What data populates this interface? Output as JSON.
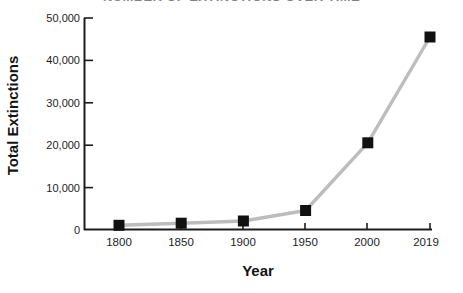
{
  "title": "NUMBER OF EXTINCTIONS OVER TIME",
  "chart_data": {
    "type": "line",
    "title": "NUMBER OF EXTINCTIONS OVER TIME",
    "subtitle": "",
    "xlabel": "Year",
    "ylabel": "Total Extinctions",
    "x": [
      1800,
      1850,
      1900,
      1950,
      2000,
      2019
    ],
    "xtick_labels": [
      "1800",
      "1850",
      "1900",
      "1950",
      "2000",
      "2019"
    ],
    "values": [
      1000,
      1500,
      2000,
      4500,
      20500,
      45500
    ],
    "ytick_labels": [
      "0",
      "10,000",
      "20,000",
      "30,000",
      "40,000",
      "50,000"
    ],
    "ytick_values": [
      0,
      10000,
      20000,
      30000,
      40000,
      50000
    ],
    "ylim": [
      0,
      50000
    ],
    "xlim": [
      1790,
      2029
    ],
    "grid": false,
    "legend": false,
    "series": [
      {
        "name": "Total Extinctions",
        "values": [
          1000,
          1500,
          2000,
          4500,
          20500,
          45500
        ]
      }
    ],
    "marker": "square",
    "marker_color": "#111111",
    "line_color": "#bdbdbd",
    "axis_color": "#1d1d1d",
    "background_color": "#ffffff"
  }
}
